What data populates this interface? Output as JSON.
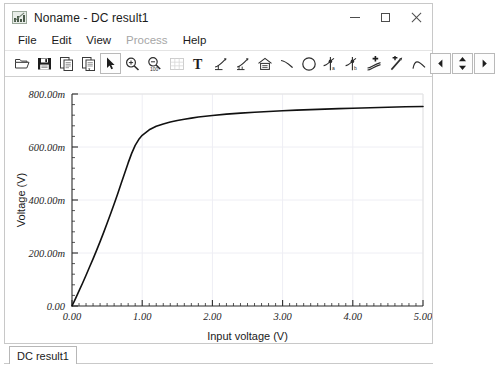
{
  "window": {
    "title": "Noname - DC result1",
    "icon": "chart-app-icon",
    "caption_buttons": [
      {
        "name": "minimize",
        "glyph": "minimize-icon"
      },
      {
        "name": "maximize",
        "glyph": "maximize-icon"
      },
      {
        "name": "close",
        "glyph": "close-icon"
      }
    ]
  },
  "menu": {
    "items": [
      {
        "label": "File",
        "disabled": false
      },
      {
        "label": "Edit",
        "disabled": false
      },
      {
        "label": "View",
        "disabled": false
      },
      {
        "label": "Process",
        "disabled": true
      },
      {
        "label": "Help",
        "disabled": false
      }
    ]
  },
  "toolbar": {
    "groups": [
      {
        "buttons": [
          {
            "name": "open-icon",
            "title": "Open"
          },
          {
            "name": "save-icon",
            "title": "Save"
          }
        ]
      },
      {
        "buttons": [
          {
            "name": "copy-icon",
            "title": "Copy"
          },
          {
            "name": "paste-icon",
            "title": "Paste"
          }
        ]
      },
      {
        "buttons": [
          {
            "name": "pointer-icon",
            "title": "Select",
            "active": true
          },
          {
            "name": "zoom-in-icon",
            "title": "Zoom in"
          },
          {
            "name": "zoom-100-icon",
            "title": "Zoom 100%",
            "label": "100"
          },
          {
            "name": "grid-icon",
            "title": "Grid"
          }
        ]
      },
      {
        "buttons": [
          {
            "name": "text-tool-icon",
            "title": "Text",
            "label": "T"
          },
          {
            "name": "curve-marker-icon",
            "title": "Curve marker"
          },
          {
            "name": "curve-marker-2-icon",
            "title": "Curve marker 2"
          },
          {
            "name": "axes-home-icon",
            "title": "Axes"
          },
          {
            "name": "line-icon",
            "title": "Line"
          },
          {
            "name": "circle-icon",
            "title": "Circle"
          }
        ]
      },
      {
        "buttons": [
          {
            "name": "cursor-a-icon",
            "title": "Cursor A"
          },
          {
            "name": "cursor-b-icon",
            "title": "Cursor B"
          }
        ]
      },
      {
        "buttons": [
          {
            "name": "add-trace-icon",
            "title": "Add trace"
          },
          {
            "name": "pick-trace-icon",
            "title": "Pick trace"
          },
          {
            "name": "peak-icon",
            "title": "Peak"
          }
        ]
      },
      {
        "buttons": [
          {
            "name": "step-prev-icon",
            "title": "Previous"
          },
          {
            "name": "spinner-icon",
            "title": "Step"
          },
          {
            "name": "step-next-icon",
            "title": "Next"
          }
        ]
      }
    ]
  },
  "status_bar": {
    "tab_label": "DC result1"
  },
  "chart_data": {
    "type": "line",
    "title": "",
    "xlabel": "Input voltage (V)",
    "ylabel": "Voltage (V)",
    "xlim": [
      0.0,
      5.0
    ],
    "ylim": [
      0.0,
      0.8
    ],
    "xticks": [
      0.0,
      1.0,
      2.0,
      3.0,
      4.0,
      5.0
    ],
    "xtick_labels": [
      "0.00",
      "1.00",
      "2.00",
      "3.00",
      "4.00",
      "5.00"
    ],
    "yticks": [
      0.0,
      0.2,
      0.4,
      0.6,
      0.8
    ],
    "ytick_labels": [
      "0.00",
      "200.00m",
      "400.00m",
      "600.00m",
      "800.00m"
    ],
    "minor_ticks_per_major_x": 10,
    "minor_ticks_per_major_y": 5,
    "grid": true,
    "grid_color": "#eeeef4",
    "legend": null,
    "series": [
      {
        "name": "Voltage",
        "color": "#111111",
        "width": 1.6,
        "x": [
          0.0,
          0.05,
          0.1,
          0.15,
          0.2,
          0.25,
          0.3,
          0.35,
          0.4,
          0.45,
          0.5,
          0.55,
          0.6,
          0.65,
          0.7,
          0.75,
          0.8,
          0.85,
          0.9,
          0.95,
          1.0,
          1.1,
          1.2,
          1.3,
          1.4,
          1.5,
          1.6,
          1.7,
          1.8,
          1.9,
          2.0,
          2.2,
          2.4,
          2.6,
          2.8,
          3.0,
          3.2,
          3.4,
          3.6,
          3.8,
          4.0,
          4.25,
          4.5,
          4.75,
          5.0
        ],
        "y": [
          0.0,
          0.028,
          0.057,
          0.086,
          0.116,
          0.147,
          0.178,
          0.21,
          0.243,
          0.277,
          0.312,
          0.348,
          0.385,
          0.423,
          0.462,
          0.501,
          0.54,
          0.576,
          0.606,
          0.628,
          0.644,
          0.665,
          0.678,
          0.687,
          0.694,
          0.7,
          0.705,
          0.709,
          0.713,
          0.716,
          0.719,
          0.724,
          0.728,
          0.731,
          0.734,
          0.737,
          0.739,
          0.741,
          0.743,
          0.745,
          0.746,
          0.748,
          0.75,
          0.752,
          0.753
        ]
      }
    ],
    "axis_color": "#2b2b2b",
    "plot_background": "#ffffff",
    "tick_label_style": "italic"
  }
}
